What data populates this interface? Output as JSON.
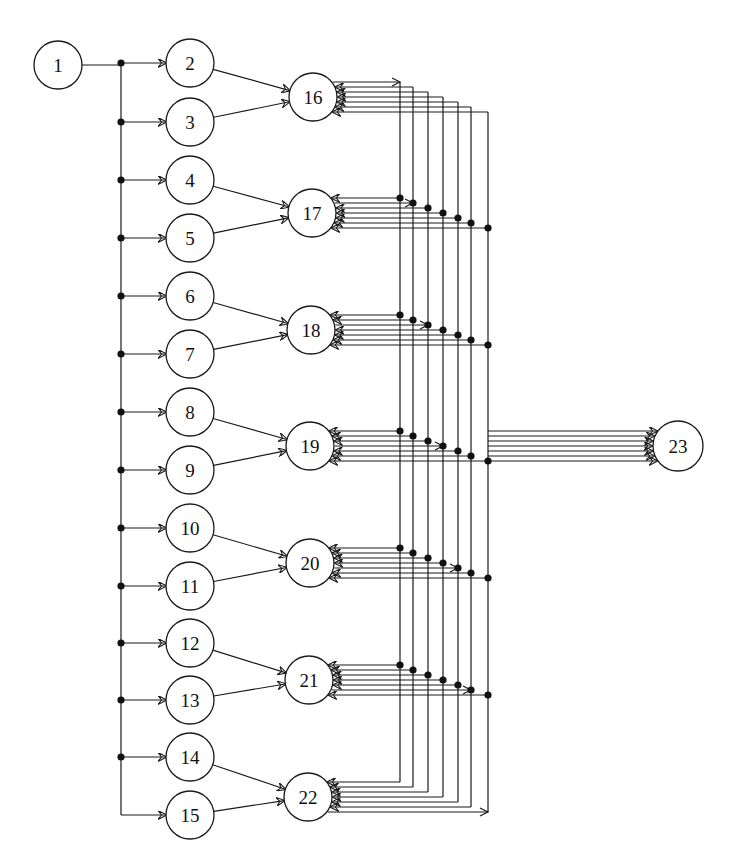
{
  "diagram": {
    "type": "directed-graph",
    "colors": {
      "stroke": "#1a1a1a",
      "background": "#ffffff",
      "dot": "#111111"
    },
    "nodes": [
      {
        "id": "1",
        "x": 58,
        "y": 65,
        "r": 24
      },
      {
        "id": "2",
        "x": 190,
        "y": 63,
        "r": 24
      },
      {
        "id": "3",
        "x": 190,
        "y": 122,
        "r": 24
      },
      {
        "id": "4",
        "x": 190,
        "y": 180,
        "r": 24
      },
      {
        "id": "5",
        "x": 190,
        "y": 238,
        "r": 24
      },
      {
        "id": "6",
        "x": 190,
        "y": 296,
        "r": 24
      },
      {
        "id": "7",
        "x": 190,
        "y": 354,
        "r": 24
      },
      {
        "id": "8",
        "x": 190,
        "y": 412,
        "r": 24
      },
      {
        "id": "9",
        "x": 190,
        "y": 470,
        "r": 24
      },
      {
        "id": "10",
        "x": 190,
        "y": 528,
        "r": 24
      },
      {
        "id": "11",
        "x": 190,
        "y": 586,
        "r": 24
      },
      {
        "id": "12",
        "x": 190,
        "y": 643,
        "r": 24
      },
      {
        "id": "13",
        "x": 190,
        "y": 700,
        "r": 24
      },
      {
        "id": "14",
        "x": 190,
        "y": 757,
        "r": 24
      },
      {
        "id": "15",
        "x": 190,
        "y": 815,
        "r": 24
      },
      {
        "id": "16",
        "x": 313,
        "y": 97,
        "r": 24
      },
      {
        "id": "17",
        "x": 312,
        "y": 213,
        "r": 24
      },
      {
        "id": "18",
        "x": 311,
        "y": 330,
        "r": 24
      },
      {
        "id": "19",
        "x": 310,
        "y": 446,
        "r": 24
      },
      {
        "id": "20",
        "x": 310,
        "y": 563,
        "r": 24
      },
      {
        "id": "21",
        "x": 309,
        "y": 680,
        "r": 24
      },
      {
        "id": "22",
        "x": 308,
        "y": 797,
        "r": 24
      },
      {
        "id": "23",
        "x": 678,
        "y": 446,
        "r": 25
      }
    ],
    "trunk": {
      "x": 121,
      "y_top": 58,
      "y_bottom": 815,
      "source": "1"
    },
    "trunk_targets": [
      "2",
      "3",
      "4",
      "5",
      "6",
      "7",
      "8",
      "9",
      "10",
      "11",
      "12",
      "13",
      "14",
      "15"
    ],
    "pair_edges": [
      [
        "2",
        "16"
      ],
      [
        "3",
        "16"
      ],
      [
        "4",
        "17"
      ],
      [
        "5",
        "17"
      ],
      [
        "6",
        "18"
      ],
      [
        "7",
        "18"
      ],
      [
        "8",
        "19"
      ],
      [
        "9",
        "19"
      ],
      [
        "10",
        "20"
      ],
      [
        "11",
        "20"
      ],
      [
        "12",
        "21"
      ],
      [
        "13",
        "21"
      ],
      [
        "14",
        "22"
      ],
      [
        "15",
        "22"
      ]
    ],
    "bus": {
      "x": [
        400,
        413,
        428,
        443,
        458,
        471,
        488
      ],
      "hubs": [
        "16",
        "17",
        "18",
        "19",
        "20",
        "21",
        "22"
      ],
      "line_spacing": 5
    },
    "hub_to_23": "19",
    "edge_summary": "1 → 2..15; (2k,2k+1) → hub 15+k; hubs 16–22 fully interconnected via 7 vertical buses; hub 19 linked to 23 by 7 parallel lines"
  }
}
